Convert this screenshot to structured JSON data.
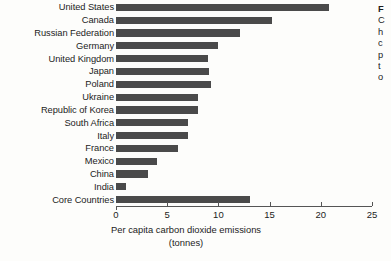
{
  "chart_data": {
    "type": "bar",
    "orientation": "horizontal",
    "title": "",
    "xlabel": "Per capita carbon dioxide emissions",
    "xunit": "(tonnes)",
    "ylabel": "",
    "xlim": [
      0,
      25
    ],
    "xticks": [
      0,
      5,
      10,
      15,
      20,
      25
    ],
    "xtick_labels": [
      "0",
      "5",
      "10",
      "15",
      "20",
      "25"
    ],
    "grid": false,
    "legend": false,
    "bar_color": "#4a4a4a",
    "categories": [
      "United States",
      "Canada",
      "Russian Federation",
      "Germany",
      "United Kingdom",
      "Japan",
      "Poland",
      "Ukraine",
      "Republic of Korea",
      "South Africa",
      "Italy",
      "France",
      "Mexico",
      "China",
      "India",
      "Core Countries"
    ],
    "values": [
      20.8,
      15.2,
      12.1,
      10.0,
      9.0,
      9.1,
      9.3,
      8.0,
      8.0,
      7.0,
      7.0,
      6.1,
      4.0,
      3.1,
      1.0,
      13.1
    ]
  },
  "side_note": {
    "title": "F",
    "lines": [
      "C",
      "h",
      "c",
      "p",
      "t",
      "o"
    ]
  }
}
